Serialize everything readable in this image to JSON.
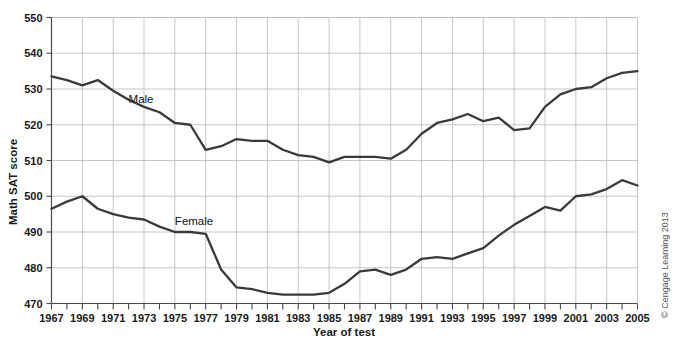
{
  "chart_data": {
    "type": "line",
    "title": "",
    "xlabel": "Year of test",
    "ylabel": "Math SAT score",
    "xlim": [
      1967,
      2005
    ],
    "ylim": [
      470,
      550
    ],
    "grid": true,
    "legend": "inline-labels",
    "x_tick_labels": [
      "1967",
      "1969",
      "1971",
      "1973",
      "1975",
      "1977",
      "1979",
      "1981",
      "1983",
      "1985",
      "1987",
      "1989",
      "1991",
      "1993",
      "1995",
      "1997",
      "1999",
      "2001",
      "2003",
      "2005"
    ],
    "x_tick_step_minor": 1,
    "y_tick_labels": [
      "470",
      "480",
      "490",
      "500",
      "510",
      "520",
      "530",
      "540",
      "550"
    ],
    "y_tick_step": 10,
    "x": [
      1967,
      1968,
      1969,
      1970,
      1971,
      1972,
      1973,
      1974,
      1975,
      1976,
      1977,
      1978,
      1979,
      1980,
      1981,
      1982,
      1983,
      1984,
      1985,
      1986,
      1987,
      1988,
      1989,
      1990,
      1991,
      1992,
      1993,
      1994,
      1995,
      1996,
      1997,
      1998,
      1999,
      2000,
      2001,
      2002,
      2003,
      2004,
      2005
    ],
    "series": [
      {
        "name": "Male",
        "label": "Male",
        "label_x": 1972,
        "label_y": 526,
        "color": "#3a3a3a",
        "values": [
          533.5,
          532.5,
          531.0,
          532.5,
          529.5,
          527.0,
          525.0,
          523.5,
          520.5,
          520.0,
          513.0,
          514.0,
          516.0,
          515.5,
          515.5,
          513.0,
          511.5,
          511.0,
          509.5,
          511.0,
          511.0,
          511.0,
          510.5,
          513.0,
          517.5,
          520.5,
          521.5,
          523.0,
          521.0,
          522.0,
          518.5,
          519.0,
          525.0,
          528.5,
          530.0,
          530.5,
          533.0,
          534.5,
          535.0
        ]
      },
      {
        "name": "Female",
        "label": "Female",
        "label_x": 1975,
        "label_y": 492,
        "color": "#3a3a3a",
        "values": [
          496.5,
          498.5,
          500.0,
          496.5,
          495.0,
          494.0,
          493.5,
          491.5,
          490.0,
          490.0,
          489.5,
          479.5,
          474.5,
          474.0,
          473.0,
          472.5,
          472.5,
          472.5,
          473.0,
          475.5,
          479.0,
          479.5,
          478.0,
          479.5,
          482.5,
          483.0,
          482.5,
          484.0,
          485.5,
          489.0,
          492.0,
          494.5,
          497.0,
          496.0,
          500.0,
          500.5,
          502.0,
          504.5,
          503.0
        ]
      }
    ],
    "credit": "© Cengage Learning 2013"
  }
}
